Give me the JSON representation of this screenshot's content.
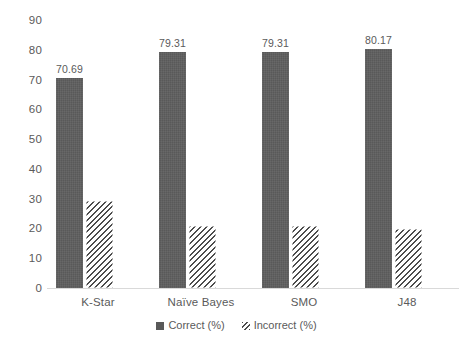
{
  "chart_data": {
    "type": "bar",
    "title": "",
    "subtitle": "",
    "xlabel": "",
    "ylabel": "",
    "grid": false,
    "legend_position": "bottom",
    "categories": [
      "K-Star",
      "Naïve Bayes",
      "SMO",
      "J48"
    ],
    "ylim": [
      0,
      90
    ],
    "yticks": [
      "0",
      "10",
      "20",
      "30",
      "40",
      "50",
      "60",
      "70",
      "80",
      "90"
    ],
    "ytick_values": [
      0,
      10,
      20,
      30,
      40,
      50,
      60,
      70,
      80,
      90
    ],
    "series": [
      {
        "name": "Correct (%)",
        "values": [
          70.69,
          79.31,
          79.31,
          80.17
        ],
        "labels": [
          "70.69",
          "79.31",
          "79.31",
          "80.17"
        ],
        "color": "#595959",
        "pattern": "solid"
      },
      {
        "name": "Incorrect (%)",
        "values": [
          29.31,
          20.69,
          20.69,
          19.83
        ],
        "labels": [
          "",
          "",
          "",
          ""
        ],
        "color": "#ffffff",
        "pattern": "diagonal-hatch"
      }
    ]
  },
  "legend": {
    "items": [
      {
        "label": "Correct (%)",
        "swatch": "solid-dark-square-icon"
      },
      {
        "label": "Incorrect (%)",
        "swatch": "hatched-square-icon"
      }
    ]
  }
}
